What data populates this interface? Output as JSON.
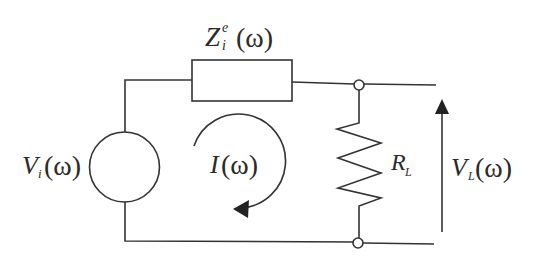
{
  "diagram": {
    "type": "circuit-schematic",
    "labels": {
      "impedance": {
        "symbol": "Z",
        "superscript": "e",
        "subscript": "i",
        "arg": "(ω)"
      },
      "source_voltage": {
        "symbol": "V",
        "subscript": "i",
        "arg": "(ω)"
      },
      "current": {
        "symbol": "I",
        "arg": "(ω)"
      },
      "load_resistor": {
        "symbol": "R",
        "subscript": "L"
      },
      "load_voltage": {
        "symbol": "V",
        "subscript": "L",
        "arg": "(ω)"
      }
    },
    "components": [
      {
        "id": "source",
        "kind": "voltage-source",
        "label": "V_i(ω)"
      },
      {
        "id": "impedance",
        "kind": "impedance-box",
        "label": "Z_i^e(ω)"
      },
      {
        "id": "load",
        "kind": "resistor",
        "label": "R_L"
      },
      {
        "id": "loop-current",
        "kind": "current-arrow",
        "direction": "clockwise",
        "label": "I(ω)"
      },
      {
        "id": "output-voltage",
        "kind": "voltage-arrow",
        "direction": "up",
        "label": "V_L(ω)"
      }
    ],
    "colors": {
      "line": "#333333",
      "text": "#2a2a2a",
      "background": "#ffffff"
    }
  }
}
